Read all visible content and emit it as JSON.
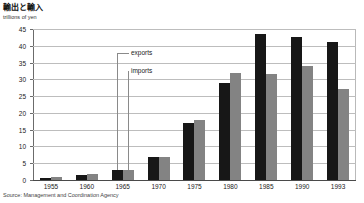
{
  "chart_data": {
    "type": "bar",
    "title": "輸出と輸入",
    "subtitle": "",
    "ylabel": "trillions of yen",
    "xlabel": "",
    "ylim": [
      0,
      45
    ],
    "yticks": [
      0,
      5,
      10,
      15,
      20,
      25,
      30,
      35,
      40,
      45
    ],
    "ytick_labels": [
      "0",
      "5",
      "10",
      "15",
      "20",
      "25",
      "30",
      "35",
      "40",
      "45"
    ],
    "grid": true,
    "legend_position": "inside-callout",
    "categories": [
      "1955",
      "1960",
      "1965",
      "1970",
      "1975",
      "1980",
      "1985",
      "1990",
      "1993"
    ],
    "series": [
      {
        "name": "exports",
        "color": "#171717",
        "values": [
          0.7,
          1.5,
          3.0,
          7.0,
          17.0,
          29.0,
          43.5,
          42.5,
          41.0
        ]
      },
      {
        "name": "imports",
        "color": "#838383",
        "values": [
          0.9,
          1.8,
          3.0,
          6.8,
          18.0,
          32.0,
          31.5,
          34.0,
          27.0
        ]
      }
    ],
    "annotations": [
      {
        "name": "exports-callout",
        "text": "exports",
        "target_series": "exports",
        "target_category": "1965"
      },
      {
        "name": "imports-callout",
        "text": "imports",
        "target_series": "imports",
        "target_category": "1965"
      }
    ],
    "source": "Source: Management and Coordination Agency"
  },
  "colors": {
    "exports": "#171717",
    "imports": "#838383",
    "grid": "#bdbdbd",
    "axis": "#6b6b6b",
    "text": "#1a1a1a"
  }
}
